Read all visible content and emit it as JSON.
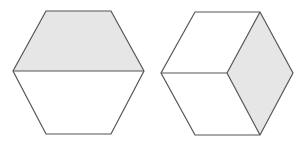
{
  "diagram": {
    "colors": {
      "stroke": "#555555",
      "shade": "#e6e6e6",
      "fill": "#ffffff"
    },
    "hexagons": [
      {
        "id": "left",
        "outline": "46,11 111,11 144,71 111,134 46,134 13,71",
        "shaded_region": "46,11 111,11 144,71 13,71",
        "divider": {
          "x1": 13,
          "y1": 71,
          "x2": 144,
          "y2": 71
        }
      },
      {
        "id": "right",
        "outline": "195,12 260,12 293,73 260,135 195,135 161,73",
        "shaded_region": "260,12 293,73 260,135 227,73",
        "dividers": [
          {
            "x1": 161,
            "y1": 73,
            "x2": 227,
            "y2": 73
          },
          {
            "x1": 227,
            "y1": 73,
            "x2": 260,
            "y2": 12
          },
          {
            "x1": 227,
            "y1": 73,
            "x2": 260,
            "y2": 135
          }
        ]
      }
    ]
  }
}
